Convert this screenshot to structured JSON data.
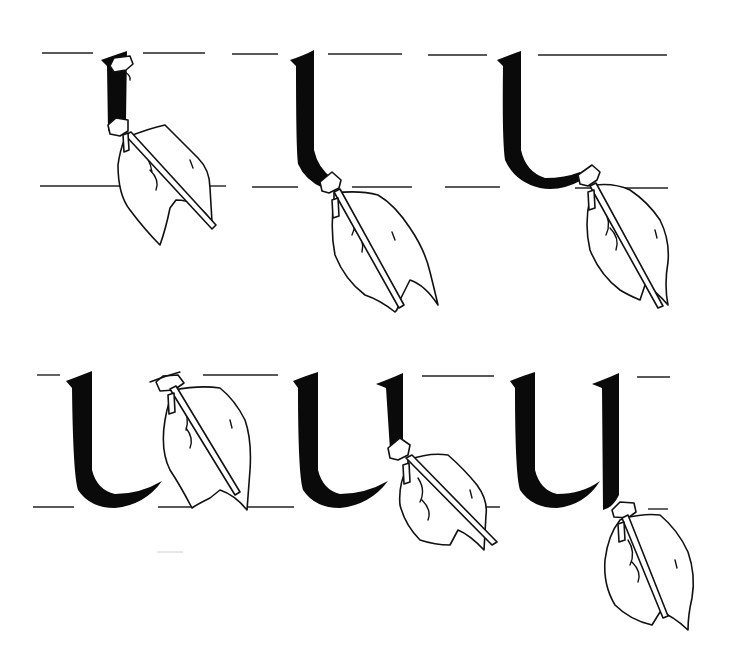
{
  "illustration": {
    "subject": "Broad-nib calligraphy pen stroke sequence for the letter u",
    "background_color": "#ffffff",
    "ink_color": "#0a0a0a",
    "panels": [
      {
        "index": 1,
        "row": 1,
        "stage": "first downstroke begun",
        "letter_progress": "short vertical stem"
      },
      {
        "index": 2,
        "row": 1,
        "stage": "stem curving at baseline",
        "letter_progress": "stem with start of curve"
      },
      {
        "index": 3,
        "row": 1,
        "stage": "bowl stroke completed",
        "letter_progress": "l-shaped hook"
      },
      {
        "index": 4,
        "row": 2,
        "stage": "pen lifted to second stem top",
        "letter_progress": "completed first stroke"
      },
      {
        "index": 5,
        "row": 2,
        "stage": "second stem being drawn",
        "letter_progress": "second stem half way"
      },
      {
        "index": 6,
        "row": 2,
        "stage": "letter complete",
        "letter_progress": "full letter u"
      }
    ],
    "guide_lines": {
      "row1": {
        "ascender_y": 53,
        "baseline_y": 186
      },
      "row2": {
        "ascender_y": 376,
        "baseline_y": 507
      }
    }
  }
}
